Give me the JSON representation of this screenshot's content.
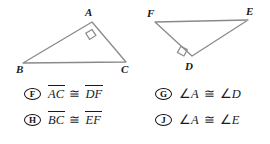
{
  "figures": {
    "left_triangle": {
      "name": "triangle-ABC",
      "vertices": [
        {
          "label": "A",
          "x": 85,
          "y": 11
        },
        {
          "label": "B",
          "x": 16,
          "y": 62
        },
        {
          "label": "C",
          "x": 120,
          "y": 62
        }
      ],
      "right_angle_at": "A",
      "line_color": "#8a8a8a"
    },
    "right_triangle": {
      "name": "triangle-DEF",
      "vertices": [
        {
          "label": "F",
          "x": 152,
          "y": 11
        },
        {
          "label": "E",
          "x": 246,
          "y": 11
        },
        {
          "label": "D",
          "x": 186,
          "y": 64
        }
      ],
      "right_angle_at": "D",
      "line_color": "#8a8a8a"
    }
  },
  "choices": [
    {
      "letter": "F",
      "kind": "segment",
      "left": "AC",
      "right": "DF",
      "relation": "≅",
      "text": "AC ≅ DF"
    },
    {
      "letter": "G",
      "kind": "angle",
      "left": "A",
      "right": "D",
      "relation": "≅",
      "angle_symbol": "∠",
      "text": "∠A ≅ ∠D"
    },
    {
      "letter": "H",
      "kind": "segment",
      "left": "BC",
      "right": "EF",
      "relation": "≅",
      "text": "BC ≅ EF"
    },
    {
      "letter": "J",
      "kind": "angle",
      "left": "A",
      "right": "E",
      "relation": "≅",
      "angle_symbol": "∠",
      "text": "∠A ≅ ∠E"
    }
  ]
}
